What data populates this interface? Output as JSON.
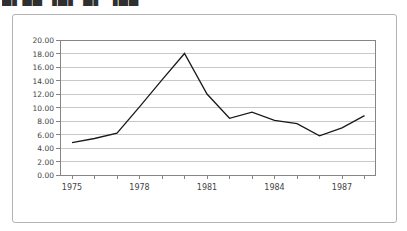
{
  "header": {
    "cropped_title_fragment": "▄▖▄▄ ▗▄▖ ▄▖ ▗▄▄"
  },
  "colors": {
    "line": "#1a1a1a",
    "grid": "#c9c9c9",
    "frame": "#858585",
    "tick": "#858585",
    "label_text": "#444444",
    "card_border": "#b3b3b3",
    "background": "#ffffff"
  },
  "chart_data": {
    "type": "line",
    "title": "",
    "xlabel": "",
    "ylabel": "",
    "x_years": [
      1975,
      1976,
      1977,
      1978,
      1979,
      1980,
      1981,
      1982,
      1983,
      1984,
      1985,
      1986,
      1987,
      1988
    ],
    "values": [
      4.8,
      5.4,
      6.2,
      10.1,
      14.1,
      18.0,
      12.0,
      8.4,
      9.3,
      8.1,
      7.6,
      5.8,
      7.0,
      8.8
    ],
    "ylim": [
      0,
      20
    ],
    "ytick_step": 2,
    "ytick_labels": [
      "0.00",
      "2.00",
      "4.00",
      "6.00",
      "8.00",
      "10.00",
      "12.00",
      "14.00",
      "16.00",
      "18.00",
      "20.00"
    ],
    "xtick_labels": [
      "1975",
      "1978",
      "1981",
      "1984",
      "1987"
    ],
    "xtick_label_years": [
      1975,
      1978,
      1981,
      1984,
      1987
    ],
    "grid": "horizontal",
    "legend": "none"
  }
}
